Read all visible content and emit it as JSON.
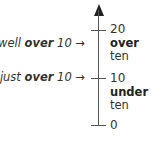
{
  "diagram": {
    "type": "number-line",
    "orientation": "vertical",
    "ticks": [
      {
        "value": "20",
        "y": 30
      },
      {
        "value": "10",
        "y": 78
      },
      {
        "value": "0",
        "y": 125
      }
    ],
    "region_labels": {
      "upper": {
        "strong": "over",
        "normal": "ten"
      },
      "lower": {
        "strong": "under",
        "normal": "ten"
      }
    },
    "pointers": {
      "well": {
        "prefix": "well ",
        "strong": "over",
        "suffix": " 10 →"
      },
      "just": {
        "prefix": "just ",
        "strong": "over",
        "suffix": " 10 →"
      }
    }
  }
}
